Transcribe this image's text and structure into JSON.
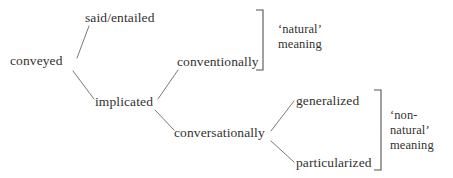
{
  "diagram": {
    "type": "tree",
    "line_color": "#6e6a66",
    "text_color": "#33312f",
    "bracket_color": "#55524f",
    "background": "#ffffff"
  },
  "nodes": {
    "root": {
      "label": "conveyed",
      "x": 10,
      "y": 65
    },
    "said": {
      "label": "said/entailed",
      "x": 85,
      "y": 22
    },
    "implicated": {
      "label": "implicated",
      "x": 95,
      "y": 106
    },
    "conventionally": {
      "label": "conventionally",
      "x": 177,
      "y": 66
    },
    "conversationally": {
      "label": "conversationally",
      "x": 174,
      "y": 137
    },
    "generalized": {
      "label": "generalized",
      "x": 296,
      "y": 105
    },
    "particularized": {
      "label": "particularized",
      "x": 296,
      "y": 167
    }
  },
  "edges": [
    {
      "name": "conveyed-to-said",
      "from": "conveyed",
      "to": "said/entailed",
      "x1": 77,
      "y1": 58,
      "x2": 89,
      "y2": 26
    },
    {
      "name": "conveyed-to-implicated",
      "from": "conveyed",
      "to": "implicated",
      "x1": 73,
      "y1": 71,
      "x2": 94,
      "y2": 99
    },
    {
      "name": "implicated-to-conventionally",
      "from": "implicated",
      "to": "conventionally",
      "x1": 158,
      "y1": 99,
      "x2": 178,
      "y2": 70
    },
    {
      "name": "implicated-to-conversationally",
      "from": "implicated",
      "to": "conversationally",
      "x1": 155,
      "y1": 110,
      "x2": 174,
      "y2": 130
    },
    {
      "name": "conversationally-to-generalized",
      "from": "conversationally",
      "to": "generalized",
      "x1": 271,
      "y1": 131,
      "x2": 294,
      "y2": 101
    },
    {
      "name": "conversationally-to-particularized",
      "from": "conversationally",
      "to": "particularized",
      "x1": 271,
      "y1": 141,
      "x2": 294,
      "y2": 162
    }
  ],
  "brackets": [
    {
      "name": "natural-meaning-bracket",
      "x": 263,
      "y_top": 10,
      "y_bottom": 70,
      "tick": 7,
      "lines": [
        "‘natural’",
        "meaning"
      ],
      "label_x": 278,
      "label_y_first": 33
    },
    {
      "name": "non-natural-meaning-bracket",
      "x": 381,
      "y_top": 90,
      "y_bottom": 170,
      "tick": 7,
      "lines": [
        "‘non-",
        "natural’",
        "meaning"
      ],
      "label_x": 390,
      "label_y_first": 119
    }
  ],
  "annotations": {
    "natural_meaning": "‘natural’ meaning",
    "non_natural_meaning": "‘non-natural’ meaning"
  }
}
